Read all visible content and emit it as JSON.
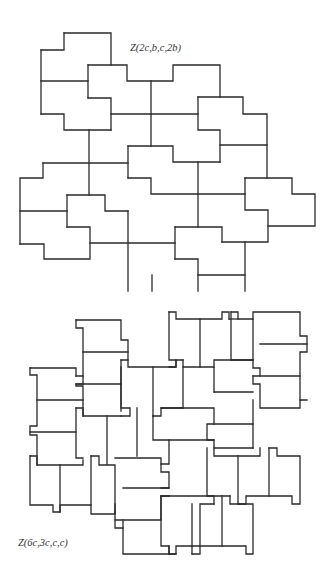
{
  "figures": [
    {
      "id": "top",
      "label": "Z(2c,b,c,2b)",
      "description": "Tiling of the plane by congruent notched L-shaped (Z-type) polyomino tiles"
    },
    {
      "id": "bottom",
      "label": "Z(6c,3c,c,c)",
      "description": "Tiling by congruent rectangular tiles with small notched tabs"
    }
  ],
  "colors": {
    "stroke": "#2a2a2a",
    "background": "#ffffff",
    "label": "#333333"
  }
}
